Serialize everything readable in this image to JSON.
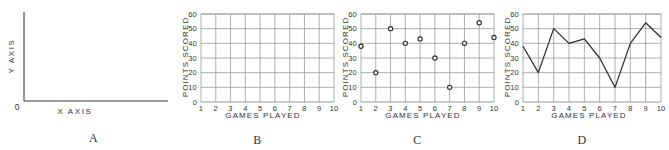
{
  "figure": {
    "panels": [
      {
        "id": "A",
        "caption": "A",
        "type": "axes-diagram",
        "origin_label": "0",
        "x_axis_label": "X  AXIS",
        "y_axis_label": "Y  AXIS"
      },
      {
        "id": "B",
        "caption": "B",
        "chart_data": {
          "type": "grid",
          "title": "",
          "xlabel": "GAMES  PLAYED",
          "ylabel": "POINTS SCORED",
          "categories": [
            1,
            2,
            3,
            4,
            5,
            6,
            7,
            8,
            9,
            10
          ],
          "x_tick_labels": [
            "1",
            "2",
            "3",
            "4",
            "5",
            "6",
            "7",
            "8",
            "9",
            "10"
          ],
          "y_tick_labels": [
            "0",
            "10",
            "20",
            "30",
            "40",
            "50",
            "60"
          ],
          "y_ticks": [
            0,
            10,
            20,
            30,
            40,
            50,
            60
          ],
          "xlim": [
            1,
            10
          ],
          "ylim": [
            0,
            60
          ],
          "grid": true,
          "legend": "none",
          "values": []
        }
      },
      {
        "id": "C",
        "caption": "C",
        "chart_data": {
          "type": "scatter",
          "title": "",
          "xlabel": "GAMES  PLAYED",
          "ylabel": "POINTS SCORED",
          "categories": [
            1,
            2,
            3,
            4,
            5,
            6,
            7,
            8,
            9,
            10
          ],
          "x_tick_labels": [
            "1",
            "2",
            "3",
            "4",
            "5",
            "6",
            "7",
            "8",
            "9",
            "10"
          ],
          "y_tick_labels": [
            "0",
            "10",
            "20",
            "30",
            "40",
            "50",
            "60"
          ],
          "y_ticks": [
            0,
            10,
            20,
            30,
            40,
            50,
            60
          ],
          "xlim": [
            1,
            10
          ],
          "ylim": [
            0,
            60
          ],
          "grid": true,
          "legend": "none",
          "marker": "open-circle",
          "values": [
            38,
            20,
            50,
            40,
            43,
            30,
            10,
            40,
            54,
            44
          ]
        }
      },
      {
        "id": "D",
        "caption": "D",
        "chart_data": {
          "type": "line",
          "title": "",
          "xlabel": "GAMES  PLAYED",
          "ylabel": "POINTS SCORED",
          "categories": [
            1,
            2,
            3,
            4,
            5,
            6,
            7,
            8,
            9,
            10
          ],
          "x_tick_labels": [
            "1",
            "2",
            "3",
            "4",
            "5",
            "6",
            "7",
            "8",
            "9",
            "10"
          ],
          "y_tick_labels": [
            "0",
            "10",
            "20",
            "30",
            "40",
            "50",
            "60"
          ],
          "y_ticks": [
            0,
            10,
            20,
            30,
            40,
            50,
            60
          ],
          "xlim": [
            1,
            10
          ],
          "ylim": [
            0,
            60
          ],
          "grid": true,
          "legend": "none",
          "marker": "none",
          "values": [
            38,
            20,
            50,
            40,
            43,
            30,
            10,
            40,
            54,
            44
          ]
        }
      }
    ],
    "colors": {
      "axis": "#3a3a3a",
      "grid": "#9a9a9a",
      "data": "#2e2e2e",
      "text": "#333333",
      "background": "#ffffff"
    }
  }
}
